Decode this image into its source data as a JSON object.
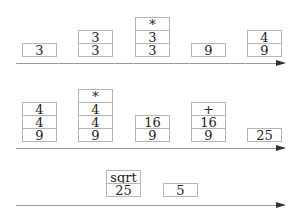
{
  "rows": [
    {
      "stacks": [
        {
          "cells": [
            "3"
          ]
        },
        {
          "cells": [
            "3",
            "3"
          ]
        },
        {
          "cells": [
            "*",
            "3",
            "3"
          ]
        },
        {
          "cells": [
            "9"
          ]
        },
        {
          "cells": [
            "4",
            "9"
          ]
        }
      ]
    },
    {
      "stacks": [
        {
          "cells": [
            "4",
            "4",
            "9"
          ]
        },
        {
          "cells": [
            "*",
            "4",
            "4",
            "9"
          ]
        },
        {
          "cells": [
            "16",
            "9"
          ]
        },
        {
          "cells": [
            "+",
            "16",
            "9"
          ]
        },
        {
          "cells": [
            "25"
          ]
        }
      ]
    },
    {
      "stacks": [
        {
          "cells": [
            "sqrt",
            "25"
          ]
        },
        {
          "cells": [
            "5"
          ]
        }
      ]
    }
  ],
  "colors": {
    "border": "#b5b5b5",
    "arrow_line": "#9a9a9a",
    "arrow_head": "#333333",
    "text": "#222222"
  }
}
